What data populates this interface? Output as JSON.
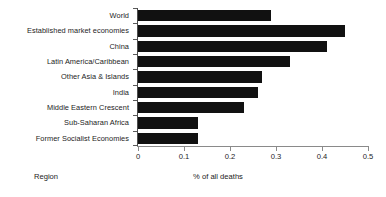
{
  "chart_data": {
    "type": "bar",
    "orientation": "horizontal",
    "title": "",
    "xlabel": "% of all deaths",
    "ylabel": "Region",
    "xlim": [
      0,
      0.5
    ],
    "xticks": [
      "0",
      "0.1",
      "0.2",
      "0.3",
      "0.4",
      "0.5"
    ],
    "xtick_values": [
      0,
      0.1,
      0.2,
      0.3,
      0.4,
      0.5
    ],
    "grid": false,
    "legend": null,
    "bar_color": "#111111",
    "categories": [
      "World",
      "Established market economies",
      "China",
      "Latin America/Caribbean",
      "Other Asia & Islands",
      "India",
      "Middle Eastern Crescent",
      "Sub-Saharan Africa",
      "Former Socialist Economies"
    ],
    "values": [
      0.29,
      0.45,
      0.41,
      0.33,
      0.27,
      0.26,
      0.23,
      0.13,
      0.13
    ]
  }
}
